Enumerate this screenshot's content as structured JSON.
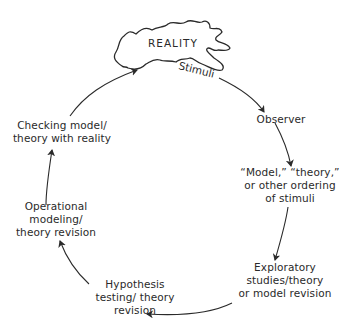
{
  "diagram": {
    "type": "cycle",
    "title": "",
    "reality_label": "REALITY",
    "stimuli_label": "Stimuli",
    "nodes": [
      {
        "id": "observer",
        "lines": [
          "Observer"
        ]
      },
      {
        "id": "model",
        "lines": [
          "“Model,” “theory,”",
          "or other ordering",
          "of stimuli"
        ]
      },
      {
        "id": "exploratory",
        "lines": [
          "Exploratory",
          "studies/theory",
          "or model revision"
        ]
      },
      {
        "id": "hypothesis",
        "lines": [
          "Hypothesis",
          "testing/ theory",
          "revision"
        ]
      },
      {
        "id": "operational",
        "lines": [
          "Operational",
          "modeling/",
          "theory revision"
        ]
      },
      {
        "id": "checking",
        "lines": [
          "Checking model/",
          "theory with reality"
        ]
      }
    ],
    "edges": [
      {
        "from": "reality",
        "to": "observer",
        "label": "Stimuli"
      },
      {
        "from": "observer",
        "to": "model"
      },
      {
        "from": "model",
        "to": "exploratory"
      },
      {
        "from": "exploratory",
        "to": "hypothesis"
      },
      {
        "from": "hypothesis",
        "to": "operational"
      },
      {
        "from": "operational",
        "to": "checking"
      },
      {
        "from": "checking",
        "to": "reality"
      }
    ],
    "colors": {
      "stroke": "#2a2a2a",
      "background": "#ffffff"
    }
  }
}
